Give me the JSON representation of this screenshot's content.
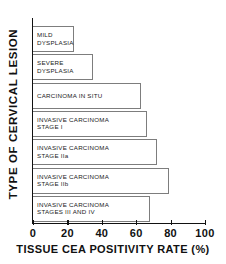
{
  "chart_data": {
    "type": "bar",
    "orientation": "horizontal",
    "title": "",
    "xlabel": "TISSUE CEA POSITIVITY RATE (%)",
    "ylabel": "TYPE OF CERVICAL LESION",
    "xlim": [
      0,
      100
    ],
    "xticks": [
      0,
      20,
      40,
      60,
      80,
      100
    ],
    "xtick_labels": [
      "0",
      "20",
      "40",
      "60",
      "80",
      "100"
    ],
    "grid": false,
    "legend": null,
    "categories": [
      "MILD DYSPLASIA",
      "SEVERE DYSPLASIA",
      "CARCINOMA IN SITU",
      "INVASIVE CARCINOMA STAGE I",
      "INVASIVE CARCINOMA STAGE IIa",
      "INVASIVE CARCINOMA STAGE IIb",
      "INVASIVE CARCINOMA STAGES III AND IV"
    ],
    "values": [
      24,
      35,
      63,
      66,
      72,
      79,
      68
    ],
    "bars": [
      {
        "label": "MILD\nDYSPLASIA",
        "value": 24
      },
      {
        "label": "SEVERE\nDYSPLASIA",
        "value": 35
      },
      {
        "label": "CARCINOMA IN SITU",
        "value": 63
      },
      {
        "label": "INVASIVE CARCINOMA\nSTAGE I",
        "value": 66
      },
      {
        "label": "INVASIVE CARCINOMA\nSTAGE  IIa",
        "value": 72
      },
      {
        "label": "INVASIVE CARCINOMA\nSTAGE  IIb",
        "value": 79
      },
      {
        "label": "INVASIVE CARCINOMA\nSTAGES  III AND IV",
        "value": 68
      }
    ],
    "colors": {
      "bar_fill": "#ffffff",
      "bar_edge": "#7d7d7d",
      "axis": "#111111",
      "text": "#111111",
      "background": "#ffffff"
    }
  }
}
